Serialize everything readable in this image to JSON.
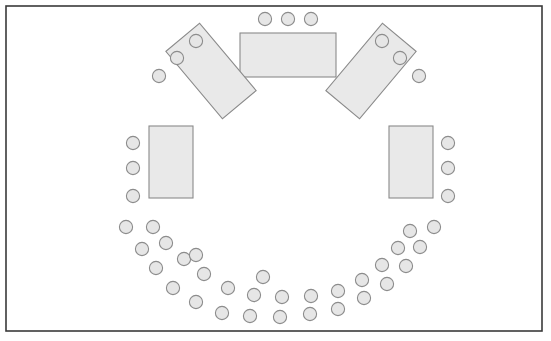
{
  "diagram": {
    "type": "floor-plan",
    "canvas": {
      "width": 551,
      "height": 341
    },
    "colors": {
      "background": "#ffffff",
      "frame_stroke": "#3a3a3a",
      "table_fill": "#e9e9e9",
      "table_stroke": "#8a8a8a",
      "seat_fill": "#e6e6e6",
      "seat_stroke": "#8c8c8c"
    },
    "frame": {
      "x": 6,
      "y": 6,
      "width": 536,
      "height": 325
    },
    "counts": {
      "tables": 5,
      "seats": 45,
      "seats_top_row": 3,
      "seats_upper_left_diagonal": 3,
      "seats_upper_right_diagonal": 3,
      "seats_left_vertical": 3,
      "seats_right_vertical": 3,
      "seats_bottom_arc": 30
    },
    "tables": [
      {
        "name": "top-center-table",
        "orientation": "horizontal",
        "x": 240,
        "y": 33,
        "width": 96,
        "height": 44,
        "rotation": 0
      },
      {
        "name": "upper-left-diagonal-table",
        "orientation": "diagonal",
        "x": 167,
        "y": 49,
        "width": 88,
        "height": 44,
        "rotation": 50
      },
      {
        "name": "upper-right-diagonal-table",
        "orientation": "diagonal",
        "x": 327,
        "y": 49,
        "width": 88,
        "height": 44,
        "rotation": -50
      },
      {
        "name": "left-vertical-table",
        "orientation": "vertical",
        "x": 149,
        "y": 126,
        "width": 44,
        "height": 72,
        "rotation": 0
      },
      {
        "name": "right-vertical-table",
        "orientation": "vertical",
        "x": 389,
        "y": 126,
        "width": 44,
        "height": 72,
        "rotation": 0
      }
    ],
    "seat_radius": 6.6,
    "seat_groups": [
      {
        "name": "top-row-seats",
        "seats": [
          {
            "cx": 265,
            "cy": 19
          },
          {
            "cx": 288,
            "cy": 19
          },
          {
            "cx": 311,
            "cy": 19
          }
        ]
      },
      {
        "name": "upper-left-diagonal-seats",
        "seats": [
          {
            "cx": 196,
            "cy": 41
          },
          {
            "cx": 177,
            "cy": 58
          },
          {
            "cx": 159,
            "cy": 76
          }
        ]
      },
      {
        "name": "upper-right-diagonal-seats",
        "seats": [
          {
            "cx": 382,
            "cy": 41
          },
          {
            "cx": 400,
            "cy": 58
          },
          {
            "cx": 419,
            "cy": 76
          }
        ]
      },
      {
        "name": "left-vertical-seats",
        "seats": [
          {
            "cx": 133,
            "cy": 143
          },
          {
            "cx": 133,
            "cy": 168
          },
          {
            "cx": 133,
            "cy": 196
          }
        ]
      },
      {
        "name": "right-vertical-seats",
        "seats": [
          {
            "cx": 448,
            "cy": 143
          },
          {
            "cx": 448,
            "cy": 168
          },
          {
            "cx": 448,
            "cy": 196
          }
        ]
      },
      {
        "name": "bottom-arc-outer-seats",
        "seats": [
          {
            "cx": 126,
            "cy": 227
          },
          {
            "cx": 142,
            "cy": 249
          },
          {
            "cx": 156,
            "cy": 268
          },
          {
            "cx": 173,
            "cy": 288
          },
          {
            "cx": 196,
            "cy": 302
          },
          {
            "cx": 222,
            "cy": 313
          },
          {
            "cx": 250,
            "cy": 316
          },
          {
            "cx": 280,
            "cy": 317
          },
          {
            "cx": 310,
            "cy": 314
          },
          {
            "cx": 338,
            "cy": 309
          },
          {
            "cx": 364,
            "cy": 298
          },
          {
            "cx": 387,
            "cy": 284
          },
          {
            "cx": 406,
            "cy": 266
          },
          {
            "cx": 420,
            "cy": 247
          },
          {
            "cx": 434,
            "cy": 227
          }
        ]
      },
      {
        "name": "bottom-arc-inner-seats",
        "seats": [
          {
            "cx": 153,
            "cy": 227
          },
          {
            "cx": 166,
            "cy": 243
          },
          {
            "cx": 184,
            "cy": 259
          },
          {
            "cx": 204,
            "cy": 274
          },
          {
            "cx": 228,
            "cy": 288
          },
          {
            "cx": 254,
            "cy": 295
          },
          {
            "cx": 282,
            "cy": 297
          },
          {
            "cx": 311,
            "cy": 296
          },
          {
            "cx": 338,
            "cy": 291
          },
          {
            "cx": 362,
            "cy": 280
          },
          {
            "cx": 382,
            "cy": 265
          },
          {
            "cx": 398,
            "cy": 248
          },
          {
            "cx": 410,
            "cy": 231
          },
          {
            "cx": 196,
            "cy": 255
          },
          {
            "cx": 263,
            "cy": 277
          }
        ]
      }
    ]
  }
}
